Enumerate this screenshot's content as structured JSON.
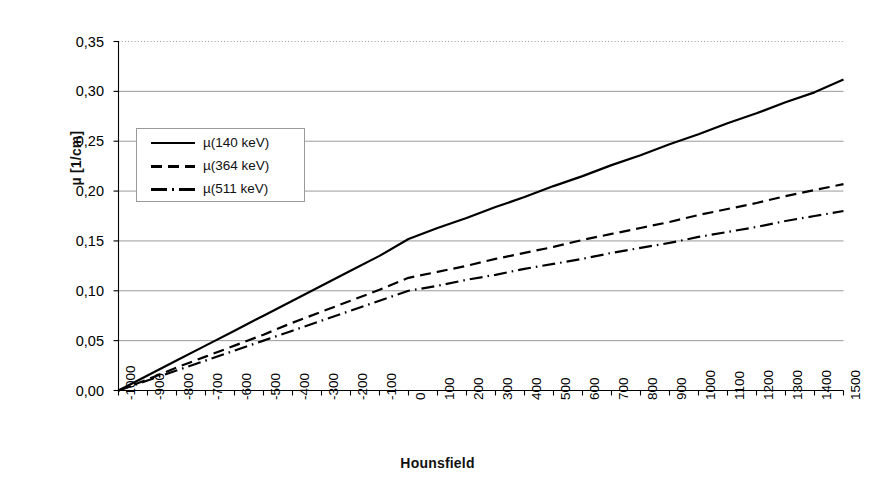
{
  "chart_data": {
    "type": "line",
    "title": "",
    "xlabel": "Hounsfield",
    "ylabel": "µ [1/cm]",
    "xlim": [
      -1000,
      1500
    ],
    "ylim": [
      0.0,
      0.35
    ],
    "grid": true,
    "legend_position": "upper-left-inside",
    "x_tick_labels": [
      "-1000",
      "-900",
      "-800",
      "-700",
      "-600",
      "-500",
      "-400",
      "-300",
      "-200",
      "-100",
      "0",
      "100",
      "200",
      "300",
      "400",
      "500",
      "600",
      "700",
      "800",
      "900",
      "1000",
      "1100",
      "1200",
      "1300",
      "1400",
      "1500"
    ],
    "y_tick_labels": [
      "0,00",
      "0,05",
      "0,10",
      "0,15",
      "0,20",
      "0,25",
      "0,30",
      "0,35"
    ],
    "x": [
      -1000,
      -900,
      -800,
      -700,
      -600,
      -500,
      -400,
      -300,
      -200,
      -100,
      0,
      100,
      200,
      300,
      400,
      500,
      600,
      700,
      800,
      900,
      1000,
      1100,
      1200,
      1300,
      1400,
      1500
    ],
    "series": [
      {
        "name": "µ(140 keV)",
        "key": "mu140",
        "style": "solid",
        "color": "#000000",
        "values": [
          0.0,
          0.015,
          0.03,
          0.045,
          0.06,
          0.075,
          0.09,
          0.105,
          0.12,
          0.135,
          0.152,
          0.163,
          0.173,
          0.184,
          0.194,
          0.205,
          0.215,
          0.226,
          0.236,
          0.247,
          0.257,
          0.268,
          0.278,
          0.289,
          0.299,
          0.312
        ]
      },
      {
        "name": "µ(364 keV)",
        "key": "mu364",
        "style": "dashed",
        "color": "#000000",
        "values": [
          0.0,
          0.011,
          0.023,
          0.034,
          0.045,
          0.056,
          0.068,
          0.079,
          0.09,
          0.101,
          0.113,
          0.119,
          0.125,
          0.132,
          0.138,
          0.144,
          0.151,
          0.157,
          0.163,
          0.169,
          0.176,
          0.182,
          0.188,
          0.195,
          0.201,
          0.207
        ]
      },
      {
        "name": "µ(511 keV)",
        "key": "mu511",
        "style": "dashdot",
        "color": "#000000",
        "values": [
          0.0,
          0.01,
          0.02,
          0.03,
          0.04,
          0.05,
          0.06,
          0.07,
          0.08,
          0.09,
          0.1,
          0.105,
          0.111,
          0.116,
          0.122,
          0.127,
          0.132,
          0.138,
          0.143,
          0.148,
          0.154,
          0.159,
          0.164,
          0.17,
          0.175,
          0.18
        ]
      }
    ]
  },
  "legend": {
    "items": [
      {
        "label": "µ(140 keV)",
        "style": "solid"
      },
      {
        "label": "µ(364 keV)",
        "style": "dashed"
      },
      {
        "label": "µ(511 keV)",
        "style": "dashdot"
      }
    ]
  },
  "axes": {
    "x_title": "Hounsfield",
    "y_title": "µ [1/cm]"
  },
  "colors": {
    "line": "#000000",
    "grid": "#8f8f8f",
    "axis": "#000000",
    "background": "#ffffff"
  }
}
